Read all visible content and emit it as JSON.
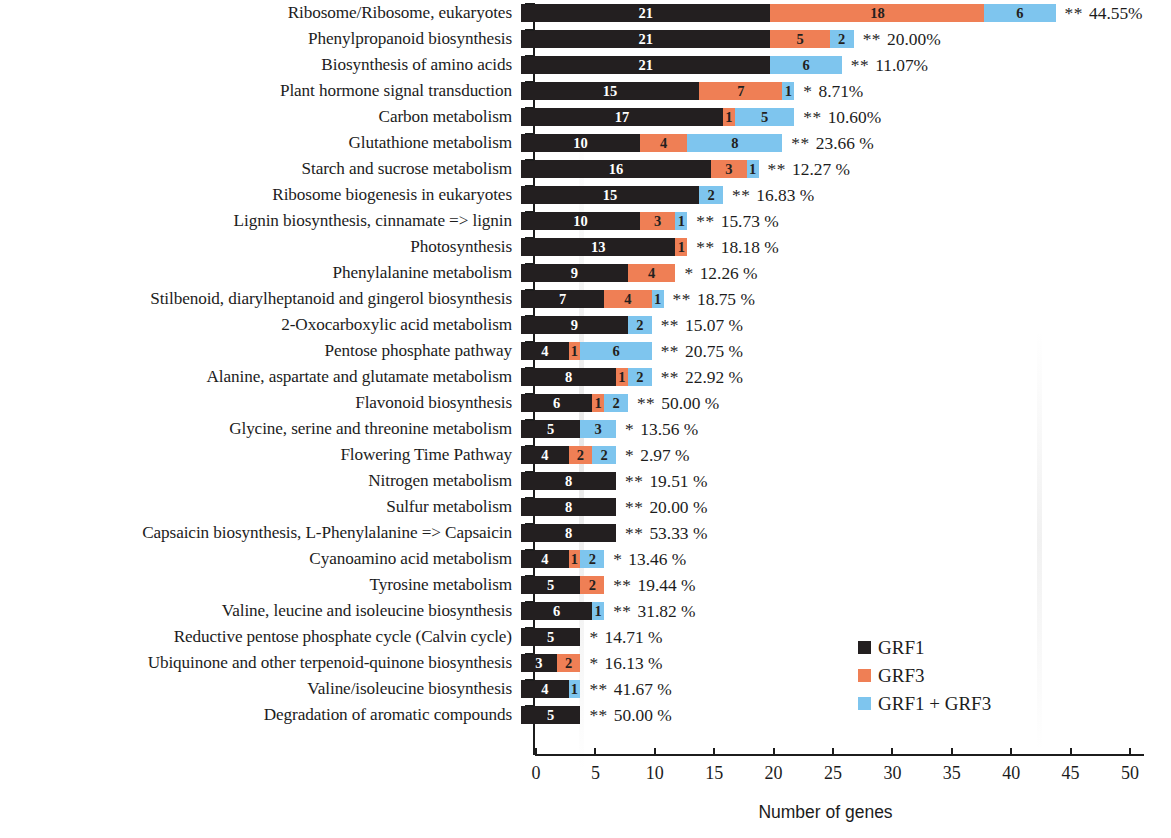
{
  "chart_data": {
    "type": "bar",
    "title": "",
    "subtitle": "",
    "orientation": "horizontal",
    "stacked": true,
    "xlabel": "Number of genes",
    "ylabel": "",
    "xlim": [
      0,
      50
    ],
    "xticks": [
      0,
      5,
      10,
      15,
      20,
      25,
      30,
      35,
      40,
      45,
      50
    ],
    "xtick_labels": [
      "0",
      "5",
      "10",
      "15",
      "20",
      "25",
      "30",
      "35",
      "40",
      "45",
      "50"
    ],
    "grid": false,
    "legend_position": "middle-right",
    "legend": [
      "GRF1",
      "GRF3",
      "GRF1 + GRF3"
    ],
    "colors": {
      "GRF1": "#231f20",
      "GRF3": "#ef7f55",
      "GRF1 + GRF3": "#7ec5ee",
      "text": "#1c1c1c",
      "background": "#ffffff"
    },
    "series": [
      {
        "name": "GRF1",
        "values": [
          21,
          21,
          21,
          15,
          17,
          10,
          16,
          15,
          10,
          13,
          9,
          7,
          9,
          4,
          8,
          6,
          5,
          4,
          8,
          8,
          8,
          4,
          5,
          6,
          5,
          3,
          4,
          5
        ]
      },
      {
        "name": "GRF3",
        "values": [
          18,
          5,
          0,
          7,
          1,
          4,
          3,
          0,
          3,
          1,
          4,
          4,
          0,
          1,
          1,
          1,
          0,
          2,
          0,
          0,
          0,
          1,
          2,
          0,
          0,
          2,
          0,
          0
        ]
      },
      {
        "name": "GRF1 + GRF3",
        "values": [
          6,
          2,
          6,
          1,
          5,
          8,
          1,
          2,
          1,
          0,
          0,
          1,
          2,
          6,
          2,
          2,
          3,
          2,
          0,
          0,
          0,
          2,
          0,
          1,
          0,
          0,
          1,
          0
        ]
      }
    ],
    "categories": [
      "Ribosome/Ribosome, eukaryotes",
      "Phenylpropanoid biosynthesis",
      "Biosynthesis of amino acids",
      "Plant hormone signal transduction",
      "Carbon metabolism",
      "Glutathione metabolism",
      "Starch and sucrose metabolism",
      "Ribosome biogenesis in eukaryotes",
      "Lignin biosynthesis, cinnamate => lignin",
      "Photosynthesis",
      "Phenylalanine metabolism",
      "Stilbenoid, diarylheptanoid and gingerol biosynthesis",
      "2-Oxocarboxylic acid metabolism",
      "Pentose phosphate pathway",
      "Alanine, aspartate and glutamate metabolism",
      "Flavonoid biosynthesis",
      "Glycine, serine and threonine metabolism",
      "Flowering Time Pathway",
      "Nitrogen metabolism",
      "Sulfur metabolism",
      "Capsaicin biosynthesis, L-Phenylalanine => Capsaicin",
      "Cyanoamino acid metabolism",
      "Tyrosine metabolism",
      "Valine, leucine and isoleucine biosynthesis",
      "Reductive pentose phosphate cycle (Calvin cycle)",
      "Ubiquinone and other terpenoid-quinone biosynthesis",
      "Valine/isoleucine biosynthesis",
      "Degradation of aromatic compounds"
    ],
    "annotations": {
      "significance_stars": [
        "**",
        "**",
        "**",
        "*",
        "**",
        "**",
        "**",
        "**",
        "**",
        "**",
        "*",
        "**",
        "**",
        "**",
        "**",
        "**",
        "*",
        "*",
        "**",
        "**",
        "**",
        "*",
        "**",
        "**",
        "*",
        "*",
        "**",
        "**"
      ],
      "percentages": [
        "44.55%",
        "20.00%",
        "11.07%",
        "8.71%",
        "10.60%",
        "23.66 %",
        "12.27 %",
        "16.83 %",
        "15.73 %",
        "18.18 %",
        "12.26 %",
        "18.75 %",
        "15.07 %",
        "20.75 %",
        "22.92 %",
        "50.00 %",
        "13.56 %",
        "2.97 %",
        "19.51 %",
        "20.00 %",
        "53.33 %",
        "13.46 %",
        "19.44 %",
        "31.82 %",
        "14.71 %",
        "16.13 %",
        "41.67 %",
        "50.00 %"
      ]
    }
  },
  "legend": {
    "items": [
      {
        "label": "GRF1",
        "color": "#231f20",
        "key": "grf1"
      },
      {
        "label": "GRF3",
        "color": "#ef7f55",
        "key": "grf3"
      },
      {
        "label": "GRF1 + GRF3",
        "color": "#7ec5ee",
        "key": "both"
      }
    ]
  },
  "axis": {
    "title": "Number of genes",
    "ticks": [
      "0",
      "5",
      "10",
      "15",
      "20",
      "25",
      "30",
      "35",
      "40",
      "45",
      "50"
    ]
  }
}
